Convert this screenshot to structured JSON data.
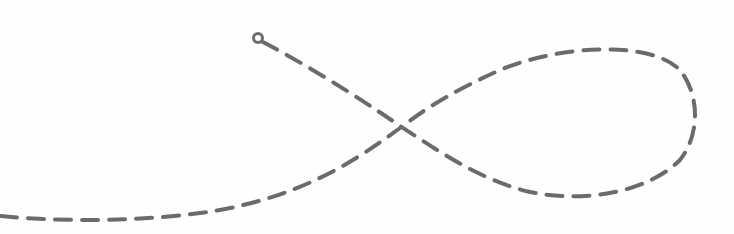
{
  "illustration": {
    "type": "dashed-loop-path",
    "stroke_color": "#6b6b6b",
    "background_color": "#fefefe",
    "stroke_width": 4,
    "dash_pattern": "16 11",
    "start_marker": {
      "shape": "circle",
      "cx": 258,
      "cy": 38,
      "r": 4.5
    },
    "path_d": "M 263 42 C 320 72, 380 112, 400 126 C 440 152, 480 180, 530 192 C 590 204, 650 190, 680 160 C 700 135, 700 95, 680 70 C 650 40, 560 45, 500 70 C 460 88, 430 105, 400 128 C 350 165, 300 195, 220 210 C 150 222, 60 222, 0 216"
  }
}
